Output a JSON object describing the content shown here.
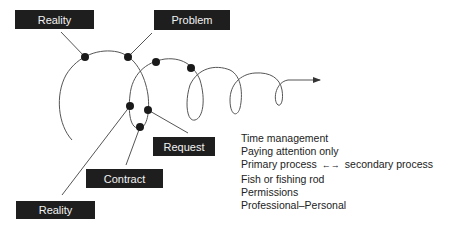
{
  "labels": {
    "reality_top": "Reality",
    "problem": "Problem",
    "request": "Request",
    "contract": "Contract",
    "reality_bottom": "Reality"
  },
  "notes": [
    "Time management",
    "Paying attention only",
    "Primary process",
    "secondary process",
    "Fish or fishing rod",
    "Permissions",
    "Professional–Personal"
  ],
  "notes_arrow": "←→",
  "colors": {
    "box_bg": "#1e1e1e",
    "box_text": "#f2f2f2",
    "line": "#555555",
    "dot": "#1a1a1a"
  }
}
